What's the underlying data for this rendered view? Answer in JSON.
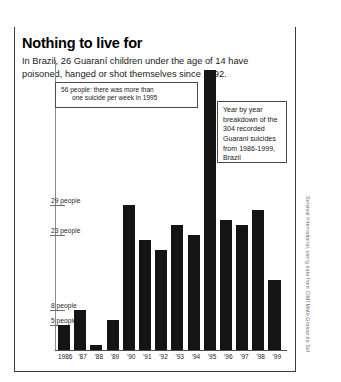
{
  "chart_data": {
    "type": "bar",
    "title": "Nothing to live for",
    "subtitle": "In Brazil, 26 Guaraní children under the age of 14 have poisoned, hanged or shot themselves since 1992.",
    "categories": [
      "1986",
      "'87",
      "'88",
      "'89",
      "'90",
      "'91",
      "'92",
      "'93",
      "'94",
      "'95",
      "'96",
      "'97",
      "'98",
      "'99"
    ],
    "values": [
      5,
      8,
      1,
      6,
      29,
      22,
      20,
      25,
      23,
      56,
      26,
      25,
      28,
      14
    ],
    "xlabel": "",
    "ylabel": "people",
    "ylim": [
      0,
      58
    ],
    "grid": false,
    "legend": false,
    "bar_color": "#141414",
    "y_ticks": [
      {
        "value": 29,
        "label": "29 people"
      },
      {
        "value": 23,
        "label": "23 people"
      },
      {
        "value": 8,
        "label": "8 people"
      },
      {
        "value": 5,
        "label": "5 people"
      }
    ],
    "annotations": [
      {
        "name": "peak-callout",
        "line1": "56 people: there was more than",
        "line2": "one suicide per week in 1995",
        "target_category": "'95",
        "target_value": 56
      },
      {
        "name": "description-box",
        "text": "Year by year breakdown of the 304 recorded Guarani suicides from 1986-1999, Brazil"
      }
    ],
    "total_recorded": 304,
    "credit": "Survival International, using data from CIMI Mato Grosso do Sul"
  }
}
